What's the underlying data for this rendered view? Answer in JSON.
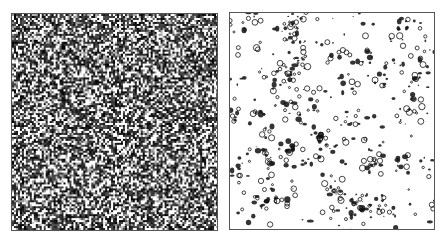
{
  "figure": {
    "background": "#ffffff",
    "panels": [
      {
        "id": "left",
        "description": "dense black-and-white contour/noise field",
        "x": 11,
        "y": 13,
        "width": 207,
        "height": 218,
        "frame_color": "#555555",
        "ink_color": "#111111",
        "paper_color": "#ffffff",
        "cell_size": 2,
        "ink_density": 0.55,
        "seed": 17
      },
      {
        "id": "right",
        "description": "sparse small closed contours (rings and blobs) on white",
        "x": 229,
        "y": 12,
        "width": 206,
        "height": 218,
        "frame_color": "#555555",
        "ink_color": "#111111",
        "paper_color": "#ffffff",
        "blob_count": 520,
        "ring_fraction": 0.45,
        "min_radius": 0.8,
        "max_radius": 3.2,
        "seed": 42
      }
    ]
  }
}
